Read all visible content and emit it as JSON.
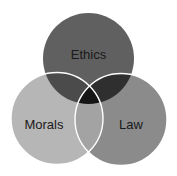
{
  "diagram": {
    "type": "venn",
    "sets": [
      {
        "id": "ethics",
        "label": "Ethics",
        "cx": 88.5,
        "cy": 58.5,
        "r": 45.5,
        "color": "#606060"
      },
      {
        "id": "morals",
        "label": "Morals",
        "cx": 57,
        "cy": 118.5,
        "r": 46,
        "color": "#b6b6b6"
      },
      {
        "id": "law",
        "label": "Law",
        "cx": 121,
        "cy": 119.5,
        "r": 46,
        "color": "#8b8b8b"
      }
    ],
    "overlaps": {
      "ethics_morals": "#4b4b4b",
      "ethics_law": "#2f2f2f",
      "morals_law": "#a3a3a3",
      "all": "#161616"
    },
    "stroke_color": "#ffffff"
  }
}
